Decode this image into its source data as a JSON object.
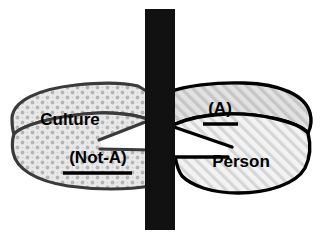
{
  "figure": {
    "background_color": "#ffffff",
    "width": 322,
    "height": 237
  },
  "divider": {
    "name": "vertical-black-bar",
    "color": "#111111",
    "x": 145,
    "y": 9,
    "width": 30,
    "height": 221
  },
  "left_region": {
    "fill_pattern": "dotted-diamond-grid",
    "pattern_color": "#b8b8b8",
    "base_color": "#e8e8e8",
    "outline_color": "#3a3a3a",
    "labels": [
      {
        "name": "culture-label",
        "text": "Culture",
        "underlined": false,
        "x": 70,
        "y": 121,
        "font_size": 17
      },
      {
        "name": "not-a-label",
        "text": "(Not-A)",
        "underlined": true,
        "x": 98,
        "y": 159,
        "font_size": 17
      }
    ]
  },
  "right_region": {
    "fill_pattern": "diagonal-hatch",
    "pattern_color": "#c4c4c4",
    "base_color": "#efefef",
    "outline_color": "#000000",
    "labels": [
      {
        "name": "a-label",
        "text": "(A)",
        "underlined": true,
        "x": 220,
        "y": 110,
        "font_size": 17
      },
      {
        "name": "person-label",
        "text": "Person",
        "underlined": false,
        "x": 241,
        "y": 163,
        "font_size": 17
      }
    ]
  },
  "colors": {
    "black": "#000000",
    "bar_black": "#111111",
    "left_outline": "#3a3a3a",
    "right_outline": "#000000",
    "white": "#ffffff"
  }
}
